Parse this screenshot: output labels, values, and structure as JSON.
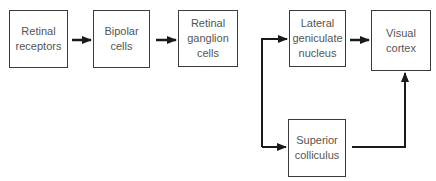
{
  "diagram": {
    "nodes": [
      {
        "id": "retinal-receptors",
        "label": "Retinal\nreceptors"
      },
      {
        "id": "bipolar-cells",
        "label": "Bipolar\ncells"
      },
      {
        "id": "retinal-ganglion-cells",
        "label": "Retinal\nganglion\ncells"
      },
      {
        "id": "lateral-geniculate-nucleus",
        "label": "Lateral\ngeniculate\nnucleus"
      },
      {
        "id": "visual-cortex",
        "label": "Visual\ncortex"
      },
      {
        "id": "superior-colliculus",
        "label": "Superior\ncolliculus"
      }
    ],
    "edges": [
      {
        "from": "retinal-receptors",
        "to": "bipolar-cells"
      },
      {
        "from": "bipolar-cells",
        "to": "retinal-ganglion-cells"
      },
      {
        "from": "retinal-ganglion-cells",
        "to": "lateral-geniculate-nucleus"
      },
      {
        "from": "retinal-ganglion-cells",
        "to": "superior-colliculus"
      },
      {
        "from": "lateral-geniculate-nucleus",
        "to": "visual-cortex"
      },
      {
        "from": "superior-colliculus",
        "to": "visual-cortex"
      }
    ],
    "colors": {
      "line": "#1a1a1a",
      "border": "#3a3a3a",
      "text": "#555555"
    }
  }
}
